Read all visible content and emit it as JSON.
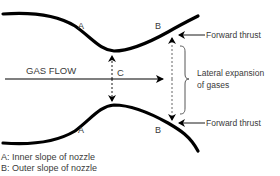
{
  "diagram": {
    "labels": {
      "gas_flow": "GAS FLOW",
      "point_a_top": "A",
      "point_b_top": "B",
      "point_a_bottom": "A",
      "point_b_bottom": "B",
      "point_c": "C",
      "forward_thrust_top": "Forward thrust",
      "forward_thrust_bottom": "Forward thrust",
      "lateral_expansion_line1": "Lateral expansion",
      "lateral_expansion_line2": "of gases"
    },
    "legend": [
      {
        "key": "A",
        "text": "A: Inner slope of nozzle"
      },
      {
        "key": "B",
        "text": "B: Outer slope of nozzle"
      }
    ],
    "colors": {
      "stroke": "#000000",
      "text": "#3a3a3a",
      "background": "#ffffff"
    }
  }
}
